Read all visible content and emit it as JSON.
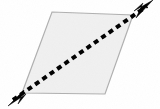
{
  "figure": {
    "canvas": {
      "width": 160,
      "height": 109,
      "background_color": "#ffffff"
    },
    "shape": {
      "name": "parallelogram",
      "fill_color": "#f0f0f0",
      "stroke_color": "#b0b0b0",
      "stroke_width": 1.2,
      "vertices": [
        {
          "label": "top-left",
          "x": 52,
          "y": 12
        },
        {
          "label": "top-right",
          "x": 133,
          "y": 15
        },
        {
          "label": "bottom-right",
          "x": 105,
          "y": 94
        },
        {
          "label": "bottom-left",
          "x": 22,
          "y": 93
        }
      ],
      "points_attribute": "52,12 133,15 105,94 22,93"
    },
    "diagonal": {
      "name": "dashed-diagonal-arrow",
      "style": "dashed",
      "color": "#000000",
      "stroke_width": 4.0,
      "dash_pattern": "5 4",
      "start": {
        "x": 13,
        "y": 100
      },
      "end": {
        "x": 147,
        "y": 6
      },
      "arrowheads": "both",
      "arrow_start_tip": {
        "x": 8,
        "y": 104
      },
      "arrow_end_tip": {
        "x": 152,
        "y": 2
      }
    },
    "arrowheads": [
      {
        "name": "arrowhead-bottom-left",
        "direction": "down-left",
        "color": "#000000",
        "points_attribute": "8,106 26,94 18,104 24,90"
      },
      {
        "name": "arrowhead-top-right",
        "direction": "up-right",
        "color": "#000000",
        "points_attribute": "153,0 134,11 143,3 136,18"
      }
    ]
  }
}
